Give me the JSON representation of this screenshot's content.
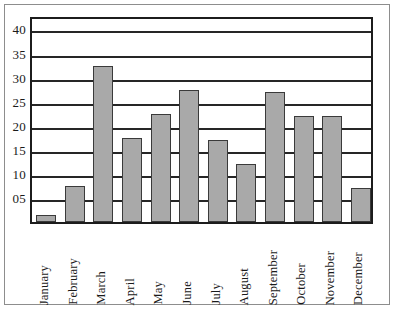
{
  "chart_data": {
    "type": "bar",
    "title": "",
    "subtitle": "",
    "xlabel": "",
    "ylabel": "",
    "categories": [
      "January",
      "February",
      "March",
      "April",
      "May",
      "June",
      "July",
      "August",
      "September",
      "October",
      "November",
      "December"
    ],
    "values": [
      1.5,
      7.5,
      32.5,
      17.5,
      22.5,
      27.5,
      17,
      12,
      27,
      22,
      22,
      7
    ],
    "ylim": [
      0,
      43
    ],
    "ytick_labels": [
      "05",
      "10",
      "15",
      "20",
      "25",
      "30",
      "35",
      "40"
    ],
    "ytick_values": [
      5,
      10,
      15,
      20,
      25,
      30,
      35,
      40
    ],
    "grid": true,
    "legend": "none",
    "series": [
      {
        "name": "",
        "values": [
          1.5,
          7.5,
          32.5,
          17.5,
          22.5,
          27.5,
          17,
          12,
          27,
          22,
          22,
          7
        ]
      }
    ],
    "colors": {
      "bar_fill": "#a9a9a9",
      "bar_border": "#3a3a3a",
      "axis": "#1c1c1c",
      "gridline": "#262626",
      "background": "#ffffff",
      "frame": "#8d8d8d"
    }
  }
}
